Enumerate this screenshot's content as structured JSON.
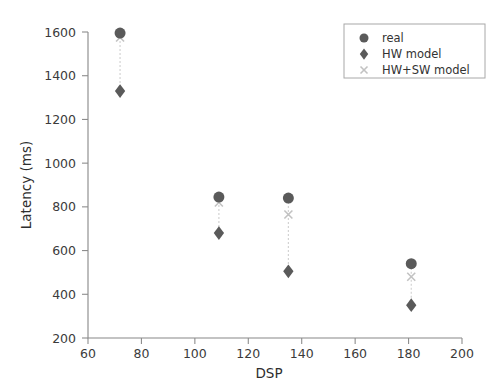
{
  "chart_data": {
    "type": "scatter",
    "title": "",
    "xlabel": "DSP",
    "ylabel": "Latency (ms)",
    "xlim": [
      60,
      200
    ],
    "ylim": [
      200,
      1600
    ],
    "xticks": [
      60,
      80,
      100,
      120,
      140,
      160,
      180,
      200
    ],
    "yticks": [
      200,
      400,
      600,
      800,
      1000,
      1200,
      1400,
      1600
    ],
    "grid": false,
    "legend_position": "upper right",
    "x": [
      72,
      109,
      135,
      181
    ],
    "series": [
      {
        "name": "real",
        "marker": "circle",
        "color": "#5a5a5a",
        "values": [
          1595,
          845,
          840,
          540
        ]
      },
      {
        "name": "HW model",
        "marker": "diamond",
        "color": "#5a5a5a",
        "values": [
          1330,
          680,
          505,
          350
        ]
      },
      {
        "name": "HW+SW model",
        "marker": "x",
        "color": "#c2c2c2",
        "values": [
          1575,
          820,
          765,
          480
        ]
      }
    ]
  },
  "axes": {
    "xlabel": "DSP",
    "ylabel": "Latency (ms)",
    "xtick_labels": [
      "60",
      "80",
      "100",
      "120",
      "140",
      "160",
      "180",
      "200"
    ],
    "ytick_labels": [
      "200",
      "400",
      "600",
      "800",
      "1000",
      "1200",
      "1400",
      "1600"
    ]
  },
  "legend": {
    "entries": [
      {
        "label": "real",
        "marker": "circle-marker"
      },
      {
        "label": "HW model",
        "marker": "diamond-marker"
      },
      {
        "label": "HW+SW model",
        "marker": "x-marker"
      }
    ]
  },
  "colors": {
    "marker_dark": "#5a5a5a",
    "marker_light": "#c2c2c2",
    "axis": "#888888",
    "text": "#333333",
    "background": "#ffffff"
  }
}
